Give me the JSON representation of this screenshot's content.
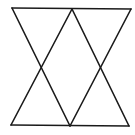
{
  "diagram": {
    "stroke_color": "#1a1a1a",
    "background_color": "#ffffff",
    "stroke_width": 1.6,
    "points": {
      "top_left": [
        12,
        8
      ],
      "top_right": [
        131,
        9
      ],
      "top_apex": [
        72,
        9
      ],
      "bottom_left": [
        11,
        125
      ],
      "bottom_right": [
        129,
        126
      ],
      "bottom_apex": [
        70,
        126
      ],
      "left_crossing": [
        41,
        67
      ],
      "right_crossing": [
        99,
        68
      ]
    },
    "lines": [
      {
        "name": "top-edge",
        "x1": 12,
        "y1": 8,
        "x2": 131,
        "y2": 9
      },
      {
        "name": "bottom-edge",
        "x1": 11,
        "y1": 125,
        "x2": 129,
        "y2": 126
      },
      {
        "name": "down-triangle-left-side",
        "x1": 12,
        "y1": 8,
        "x2": 70,
        "y2": 126
      },
      {
        "name": "down-triangle-right-side",
        "x1": 131,
        "y1": 9,
        "x2": 70,
        "y2": 126
      },
      {
        "name": "up-triangle-left-side",
        "x1": 11,
        "y1": 125,
        "x2": 72,
        "y2": 9
      },
      {
        "name": "up-triangle-right-side",
        "x1": 129,
        "y1": 126,
        "x2": 72,
        "y2": 9
      }
    ]
  }
}
